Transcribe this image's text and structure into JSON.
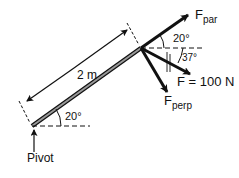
{
  "diagram": {
    "labels": {
      "f_par_main": "F",
      "f_par_sub": "par",
      "f_perp_main": "F",
      "f_perp_sub": "perp",
      "force": "F = 100 N",
      "length": "2 m",
      "angle_top": "20°",
      "angle_force": "37°",
      "angle_bottom": "20°",
      "pivot": "Pivot"
    },
    "colors": {
      "ink": "#111111",
      "rod": "#777777"
    }
  }
}
